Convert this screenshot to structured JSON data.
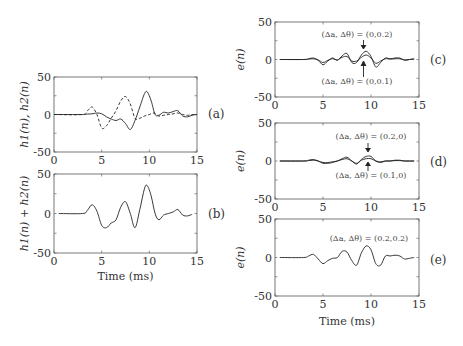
{
  "chart_data": [
    {
      "id": "a",
      "type": "line",
      "panel_label": "(a)",
      "ylabel": "h1(n), h2(n)",
      "xlabel": "",
      "xlim": [
        0,
        15
      ],
      "ylim": [
        -50,
        50
      ],
      "xticks": [
        "0",
        "5",
        "10",
        "15"
      ],
      "yticks": [
        "50",
        "0",
        "-50"
      ],
      "series": [
        {
          "name": "h1(n)",
          "style": "solid",
          "x": [
            0,
            3,
            3.5,
            4,
            4.5,
            5,
            5.5,
            6,
            6.5,
            7,
            7.5,
            8,
            8.5,
            9,
            9.5,
            9.8,
            10.2,
            10.6,
            11,
            11.5,
            12,
            12.5,
            13,
            13.5,
            14,
            14.5,
            15
          ],
          "y": [
            0,
            0,
            0.5,
            1,
            2,
            1,
            -3,
            -6,
            -8,
            -6,
            -12,
            -20,
            -8,
            10,
            28,
            30,
            18,
            0,
            -1,
            3,
            2,
            4,
            5,
            -2,
            -3,
            -1,
            0
          ]
        },
        {
          "name": "h2(n)",
          "style": "dashed",
          "x": [
            0,
            3,
            3.5,
            4,
            4.5,
            5,
            5.5,
            6,
            6.5,
            7,
            7.5,
            8,
            8.5,
            9,
            9.5,
            10,
            10.5,
            11,
            11.5,
            12,
            12.5,
            13,
            13.5,
            14,
            14.5,
            15
          ],
          "y": [
            0,
            0,
            5,
            10,
            0,
            -18,
            -15,
            -5,
            5,
            18,
            24,
            14,
            -5,
            -5,
            -2,
            0,
            2,
            -2,
            -1,
            0,
            1,
            2,
            0,
            -1,
            0,
            0
          ]
        }
      ]
    },
    {
      "id": "b",
      "type": "line",
      "panel_label": "(b)",
      "ylabel": "h1(n) + h2(n)",
      "xlabel": "Time (ms)",
      "xlim": [
        0,
        15
      ],
      "ylim": [
        -50,
        50
      ],
      "xticks": [
        "0",
        "5",
        "10",
        "15"
      ],
      "yticks": [
        "50",
        "0",
        "-50"
      ],
      "series": [
        {
          "name": "h1(n)+h2(n)",
          "style": "solid",
          "x": [
            0.5,
            3,
            3.5,
            4,
            4.5,
            5,
            5.5,
            6,
            6.5,
            7,
            7.5,
            8,
            8.5,
            9,
            9.5,
            9.8,
            10.2,
            10.6,
            11,
            11.5,
            12,
            12.5,
            13,
            13.5,
            14,
            14.5
          ],
          "y": [
            0,
            0,
            4,
            11,
            3,
            -15,
            -18,
            -12,
            -8,
            8,
            15,
            0,
            -18,
            5,
            32,
            35,
            22,
            0,
            -8,
            -2,
            0,
            2,
            5,
            -2,
            -3,
            -1
          ]
        }
      ]
    },
    {
      "id": "c",
      "type": "line",
      "panel_label": "(c)",
      "ylabel": "e(n)",
      "xlabel": "",
      "xlim": [
        0,
        15
      ],
      "ylim": [
        -50,
        50
      ],
      "xticks": [
        "0",
        "5",
        "10",
        "15"
      ],
      "yticks": [
        "50",
        "0",
        "-50"
      ],
      "annotations": [
        {
          "text": "(Δa, Δθ) = (0,0.2)",
          "arrow": "down",
          "x": 9.2
        },
        {
          "text": "(Δa, Δθ) = (0,0.1)",
          "arrow": "up",
          "x": 9.2
        }
      ],
      "series": [
        {
          "name": "(Δa, Δθ) = (0,0.2)",
          "style": "solid",
          "x": [
            0.5,
            3,
            3.5,
            4,
            4.5,
            5,
            5.5,
            6,
            6.5,
            7,
            7.5,
            8,
            8.5,
            9,
            9.5,
            10,
            10.5,
            11,
            11.5,
            12,
            12.5,
            13,
            13.5,
            14,
            14.5
          ],
          "y": [
            0,
            0,
            1,
            2,
            -1,
            -7,
            -2,
            2,
            -1,
            5,
            8,
            -4,
            -4,
            6,
            11,
            4,
            -10,
            -4,
            2,
            1,
            2,
            2,
            -1,
            0,
            1
          ]
        },
        {
          "name": "(Δa, Δθ) = (0,0.1)",
          "style": "solid",
          "x": [
            0.5,
            3,
            3.5,
            4,
            4.5,
            5,
            5.5,
            6,
            6.5,
            7,
            7.5,
            8,
            8.5,
            9,
            9.5,
            10,
            10.5,
            11,
            11.5,
            12,
            12.5,
            13,
            13.5,
            14,
            14.5
          ],
          "y": [
            0,
            0,
            0.5,
            1,
            -0.5,
            -4,
            -1,
            1,
            -0.5,
            3,
            4,
            -2,
            -2,
            3,
            6,
            2,
            -5,
            -2,
            1,
            0.5,
            1,
            1,
            -0.5,
            0,
            0.5
          ]
        }
      ]
    },
    {
      "id": "d",
      "type": "line",
      "panel_label": "(d)",
      "ylabel": "e(n)",
      "xlabel": "",
      "xlim": [
        0,
        15
      ],
      "ylim": [
        -50,
        50
      ],
      "xticks": [
        "0",
        "5",
        "10",
        "15"
      ],
      "yticks": [
        "50",
        "0",
        "-50"
      ],
      "annotations": [
        {
          "text": "(Δa, Δθ) = (0.2,0)",
          "arrow": "down",
          "x": 9.7
        },
        {
          "text": "(Δa, Δθ) = (0.1,0)",
          "arrow": "up",
          "x": 9.7
        }
      ],
      "series": [
        {
          "name": "(Δa, Δθ) = (0.2,0)",
          "style": "solid",
          "x": [
            0.5,
            3,
            3.5,
            4,
            4.5,
            5,
            5.5,
            6,
            6.5,
            7,
            7.5,
            8,
            8.5,
            9,
            9.5,
            10,
            10.5,
            11,
            11.5,
            12,
            12.5,
            13,
            13.5,
            14,
            14.5
          ],
          "y": [
            0,
            0,
            1,
            2,
            0,
            -3,
            -3,
            -2,
            0,
            3,
            5,
            0,
            -4,
            2,
            6,
            6,
            0,
            -2,
            0,
            0,
            1,
            1,
            0,
            0,
            0
          ]
        },
        {
          "name": "(Δa, Δθ) = (0.1,0)",
          "style": "solid",
          "x": [
            0.5,
            3,
            3.5,
            4,
            4.5,
            5,
            5.5,
            6,
            6.5,
            7,
            7.5,
            8,
            8.5,
            9,
            9.5,
            10,
            10.5,
            11,
            11.5,
            12,
            12.5,
            13,
            13.5,
            14,
            14.5
          ],
          "y": [
            0,
            0,
            0.5,
            1,
            0,
            -2,
            -2,
            -1,
            0,
            2,
            3,
            0,
            -3,
            1,
            3,
            3,
            0,
            -1,
            0,
            0,
            0.5,
            0.5,
            0,
            0,
            0
          ]
        }
      ]
    },
    {
      "id": "e",
      "type": "line",
      "panel_label": "(e)",
      "ylabel": "e(n)",
      "xlabel": "Time (ms)",
      "xlim": [
        0,
        15
      ],
      "ylim": [
        -50,
        50
      ],
      "xticks": [
        "0",
        "5",
        "10",
        "15"
      ],
      "yticks": [
        "50",
        "0",
        "-50"
      ],
      "annotations": [
        {
          "text": "(Δa, Δθ) = (0.2,0.2)"
        }
      ],
      "series": [
        {
          "name": "(Δa, Δθ) = (0.2,0.2)",
          "style": "solid",
          "x": [
            0.5,
            3,
            3.5,
            4,
            4.5,
            5,
            5.5,
            6,
            6.5,
            7,
            7.5,
            8,
            8.5,
            9,
            9.5,
            10,
            10.5,
            11,
            11.5,
            12,
            12.5,
            13,
            13.5,
            14,
            14.5
          ],
          "y": [
            0,
            0,
            2,
            4,
            -2,
            -8,
            -4,
            -1,
            0,
            8,
            7,
            -4,
            -10,
            6,
            15,
            10,
            -8,
            -10,
            2,
            2,
            3,
            2,
            -2,
            -1,
            0
          ]
        }
      ]
    }
  ]
}
